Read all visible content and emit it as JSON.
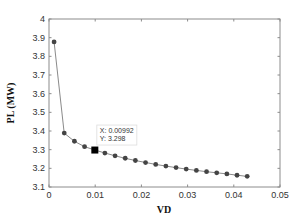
{
  "chart_data": {
    "type": "line",
    "title": "",
    "xlabel": "VD",
    "ylabel": "PL (MW)",
    "xlim": [
      0,
      0.05
    ],
    "ylim": [
      3.1,
      4.0
    ],
    "xticks": [
      0,
      0.01,
      0.02,
      0.03,
      0.04,
      0.05
    ],
    "xtick_labels": [
      "0",
      "0.01",
      "0.02",
      "0.03",
      "0.04",
      "0.05"
    ],
    "yticks": [
      3.1,
      3.2,
      3.3,
      3.4,
      3.5,
      3.6,
      3.7,
      3.8,
      3.9,
      4.0
    ],
    "ytick_labels": [
      "3.1",
      "3.2",
      "3.3",
      "3.4",
      "3.5",
      "3.6",
      "3.7",
      "3.8",
      "3.9",
      "4"
    ],
    "grid": false,
    "legend": null,
    "series": [
      {
        "name": "PL vs VD",
        "marker": "circle",
        "x": [
          0.0011,
          0.0033,
          0.0055,
          0.0077,
          0.00992,
          0.0121,
          0.0143,
          0.0165,
          0.0187,
          0.0209,
          0.0231,
          0.0253,
          0.0275,
          0.0297,
          0.0319,
          0.0341,
          0.0363,
          0.0385,
          0.0407,
          0.0429
        ],
        "y": [
          3.877,
          3.389,
          3.345,
          3.316,
          3.298,
          3.282,
          3.267,
          3.254,
          3.242,
          3.231,
          3.221,
          3.212,
          3.204,
          3.196,
          3.189,
          3.182,
          3.176,
          3.17,
          3.163,
          3.157
        ]
      }
    ],
    "annotations": [
      {
        "type": "datatip",
        "x": 0.00992,
        "y": 3.298,
        "lines": [
          "X: 0.00992",
          "Y: 3.298"
        ]
      }
    ]
  },
  "colors": {
    "line": "#8a8a8a",
    "marker": "#444444",
    "highlight_marker": "#000000",
    "axis": "#8c8c8c",
    "tip_border": "#dddddd"
  }
}
